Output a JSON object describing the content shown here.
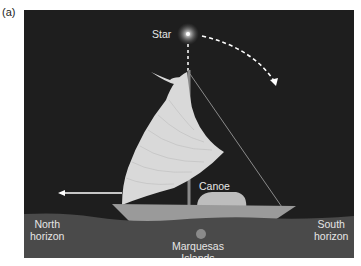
{
  "figure": {
    "panel_label": "(a)",
    "labels": {
      "star": "Star",
      "canoe": "Canoe",
      "north_horizon_line1": "North",
      "north_horizon_line2": "horizon",
      "south_horizon_line1": "South",
      "south_horizon_line2": "horizon",
      "islands_line1": "Marquesas",
      "islands_line2": "Islands"
    },
    "colors": {
      "sky": "#1e1e1e",
      "sea": "#4a4a4a",
      "sail": "#d9d9d9",
      "hull": "#9a9a9a",
      "text": "#e6e6e6"
    },
    "arrows": {
      "star_path": "dashed arc from star toward lower right",
      "direction": "arrow pointing left toward north"
    }
  }
}
